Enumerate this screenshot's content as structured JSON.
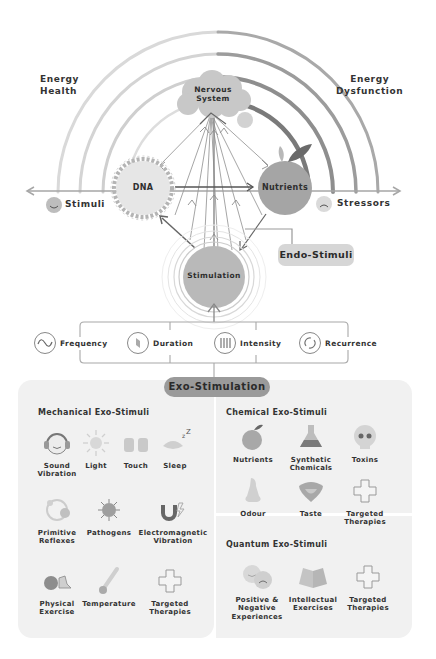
{
  "diagram": {
    "left_label": {
      "line1": "Energy",
      "line2": "Health"
    },
    "right_label": {
      "line1": "Energy",
      "line2": "Dysfunction"
    },
    "nodes": {
      "nervous_system": {
        "line1": "Nervous",
        "line2": "System"
      },
      "dna": "DNA",
      "nutrients": "Nutrients",
      "stimulation": "Stimulation"
    },
    "axis": {
      "left": "Stimuli",
      "right": "Stressors"
    },
    "endo_stimuli": "Endo-Stimuli",
    "parameters": [
      {
        "label": "Frequency",
        "icon": "sine-wave-icon"
      },
      {
        "label": "Duration",
        "icon": "hourglass-icon"
      },
      {
        "label": "Intensity",
        "icon": "bars-icon"
      },
      {
        "label": "Recurrence",
        "icon": "cycle-arrows-icon"
      }
    ],
    "exo_stimulation": "Exo-Stimulation"
  },
  "panels": {
    "mechanical": {
      "title": "Mechanical Exo-Stimuli",
      "items": [
        {
          "l1": "Sound",
          "l2": "Vibration",
          "icon": "headphones-face-icon"
        },
        {
          "l1": "Light",
          "l2": "",
          "icon": "sun-icon"
        },
        {
          "l1": "Touch",
          "l2": "",
          "icon": "hands-icon"
        },
        {
          "l1": "Sleep",
          "l2": "",
          "icon": "sleeping-eye-icon"
        },
        {
          "l1": "Primitive",
          "l2": "Reflexes",
          "icon": "reflex-cycle-icon"
        },
        {
          "l1": "Pathogens",
          "l2": "",
          "icon": "virus-icon"
        },
        {
          "l1": "Electromagnetic",
          "l2": "Vibration",
          "icon": "magnet-icon"
        },
        {
          "l1": "Physical",
          "l2": "Exercise",
          "icon": "ball-shoe-icon"
        },
        {
          "l1": "Temperature",
          "l2": "",
          "icon": "thermometer-icon"
        },
        {
          "l1": "Targeted",
          "l2": "Therapies",
          "icon": "cross-icon"
        }
      ]
    },
    "chemical": {
      "title": "Chemical Exo-Stimuli",
      "items": [
        {
          "l1": "Nutrients",
          "l2": "",
          "icon": "apple-icon"
        },
        {
          "l1": "Synthetic",
          "l2": "Chemicals",
          "icon": "flask-icon"
        },
        {
          "l1": "Toxins",
          "l2": "",
          "icon": "skull-icon"
        },
        {
          "l1": "Odour",
          "l2": "",
          "icon": "nose-icon"
        },
        {
          "l1": "Taste",
          "l2": "",
          "icon": "tongue-icon"
        },
        {
          "l1": "Targeted",
          "l2": "Therapies",
          "icon": "cross-icon"
        }
      ]
    },
    "quantum": {
      "title": "Quantum Exo-Stimuli",
      "items": [
        {
          "l1": "Positive &",
          "l2": "Negative",
          "l3": "Experiences",
          "icon": "happy-sad-faces-icon"
        },
        {
          "l1": "Intellectual",
          "l2": "Exercises",
          "icon": "open-book-icon"
        },
        {
          "l1": "Targeted",
          "l2": "Therapies",
          "icon": "cross-icon"
        }
      ]
    }
  }
}
